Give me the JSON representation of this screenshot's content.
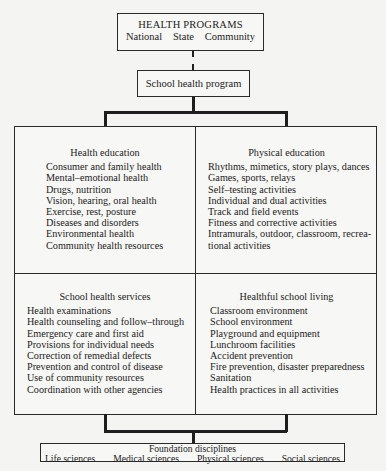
{
  "top": {
    "title": "HEALTH PROGRAMS",
    "levels": [
      "National",
      "State",
      "Community"
    ]
  },
  "school_program": {
    "label": "School health program"
  },
  "quadrants": {
    "health_education": {
      "title": "Health education",
      "items": [
        "Consumer and family health",
        "Mental–emotional health",
        "Drugs, nutrition",
        "Vision, hearing, oral health",
        "Exercise, rest, posture",
        "Diseases and disorders",
        "Environmental health",
        "Community health resources"
      ]
    },
    "physical_education": {
      "title": "Physical education",
      "items": [
        "Rhythms, mimetics, story plays, dances",
        "Games, sports, relays",
        "Self–testing activities",
        "Individual and dual activities",
        "Track and field events",
        "Fitness and corrective activities",
        "Intramurals, outdoor, classroom, recrea-",
        "tional activities"
      ]
    },
    "school_health_services": {
      "title": "School health services",
      "items": [
        "Health examinations",
        "Health counseling and follow–through",
        "Emergency care and first aid",
        "Provisions for individual needs",
        "Correction of remedial defects",
        "Prevention and control of disease",
        "Use of community resources",
        "Coordination with other agencies"
      ]
    },
    "healthful_school_living": {
      "title": "Healthful school living",
      "items": [
        "Classroom environment",
        "School environment",
        "Playground and equipment",
        "Lunchroom facilities",
        "Accident prevention",
        "Fire prevention, disaster preparedness",
        "Sanitation",
        "Health practices in all activities"
      ]
    }
  },
  "foundation": {
    "title": "Foundation disciplines",
    "disciplines": [
      "Life sciences",
      "Medical sciences",
      "Physical sciences",
      "Social sciences"
    ]
  },
  "colors": {
    "background": "#f4f4f2",
    "line": "#1e1e1e",
    "text": "#222222"
  }
}
